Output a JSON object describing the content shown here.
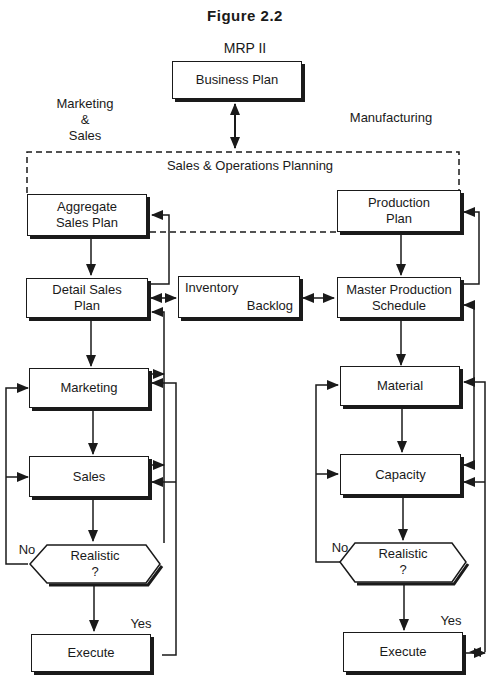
{
  "figure": {
    "title": "Figure  2.2",
    "subtitle": "MRP II"
  },
  "top": {
    "business_plan": "Business Plan",
    "left_section_label": [
      "Marketing",
      "&",
      "Sales"
    ],
    "right_section_label": "Manufacturing",
    "sop_label": "Sales & Operations Planning"
  },
  "left_column": {
    "aggregate_sales_plan": [
      "Aggregate",
      "Sales Plan"
    ],
    "detail_sales_plan": [
      "Detail Sales",
      "Plan"
    ],
    "marketing": "Marketing",
    "sales": "Sales",
    "decision": [
      "Realistic",
      "?"
    ],
    "no_label": "No",
    "yes_label": "Yes",
    "execute": "Execute"
  },
  "center": {
    "inventory": "Inventory",
    "backlog": "Backlog"
  },
  "right_column": {
    "production_plan": [
      "Production",
      "Plan"
    ],
    "master_production_schedule": [
      "Master Production",
      "Schedule"
    ],
    "material": "Material",
    "capacity": "Capacity",
    "decision": [
      "Realistic",
      "?"
    ],
    "no_label": "No",
    "yes_label": "Yes",
    "execute": "Execute"
  }
}
